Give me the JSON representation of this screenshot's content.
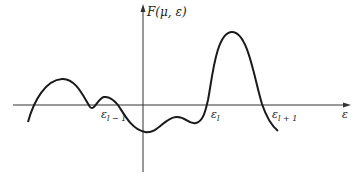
{
  "diagram": {
    "y_axis_label": "F(μ, ε)",
    "x_axis_label": "ε",
    "annotations": [
      {
        "symbol": "ε",
        "subscript": "l − 1"
      },
      {
        "symbol": "ε",
        "subscript": "l"
      },
      {
        "symbol": "ε",
        "subscript": "l + 1"
      }
    ],
    "colors": {
      "stroke": "#1a1a1a",
      "axis": "#333333",
      "background": "#ffffff"
    }
  }
}
